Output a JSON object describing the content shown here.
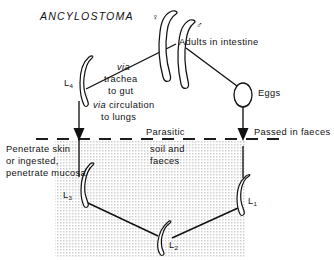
{
  "diagram": {
    "title": "ANCYLOSTOMA",
    "type": "life-cycle-diagram",
    "width": 334,
    "height": 260,
    "ink_color": "#111111",
    "background_color": "#ffffff",
    "soil_shading_color": "#d9d9d9"
  },
  "labels": {
    "adults_in_intestine": "Adults in intestine",
    "eggs": "Eggs",
    "passed_in_faeces": "Passed in faeces",
    "parasitic": "Parasitic",
    "soil_and_faeces_line1": "soil and",
    "soil_and_faeces_line2": "faeces",
    "via_word": "via",
    "trachea_line1": "trachea",
    "trachea_line2": "to gut",
    "via_circulation": "via circulation",
    "to_lungs": "to lungs",
    "penetrate_line1": "Penetrate skin",
    "penetrate_line2": "or ingested,",
    "penetrate_line3": "penetrate mucosa",
    "female_symbol": "♀",
    "male_symbol": "♂"
  },
  "stages": {
    "l4": {
      "label": "L",
      "subscript": "4"
    },
    "l3": {
      "label": "L",
      "subscript": "3"
    },
    "l2": {
      "label": "L",
      "subscript": "2"
    },
    "l1": {
      "label": "L",
      "subscript": "1"
    }
  },
  "icons": {
    "adult_female": "worm-female-icon",
    "adult_male": "worm-male-icon",
    "egg": "egg-oval-icon",
    "larva_l4": "larva-icon",
    "larva_l3": "larva-icon",
    "larva_l2": "larva-icon",
    "larva_l1": "larva-icon",
    "arrow_down_left": "arrow-down-icon",
    "arrow_down_right": "arrow-down-icon",
    "soil_boundary": "dashed-boundary-line"
  }
}
